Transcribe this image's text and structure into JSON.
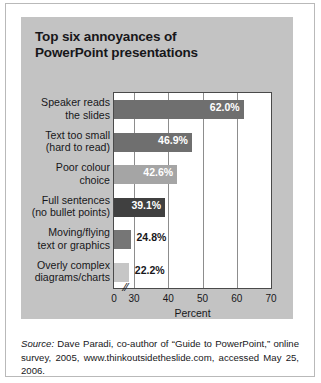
{
  "figure": {
    "title_lines": [
      "Top six annoyances of",
      "PowerPoint presentations"
    ],
    "source_label": "Source:",
    "source_text": " Dave Paradi, co-author of “Guide to PowerPoint,” online survey, 2005, www.thinkoutsidetheslide.com, accessed May 25, 2006.",
    "panel_color": "#c3c3c3",
    "plot_background": "#ffffff"
  },
  "chart_data": {
    "type": "bar",
    "orientation": "horizontal",
    "title": "Top six annoyances of PowerPoint presentations",
    "xlabel": "Percent",
    "ylabel": "",
    "xlim": [
      0,
      70
    ],
    "axis_break": {
      "present": true,
      "between": [
        0,
        30
      ],
      "symbol": "//"
    },
    "xticks": [
      "0",
      "30",
      "40",
      "50",
      "60",
      "70"
    ],
    "xtick_values": [
      0,
      30,
      40,
      50,
      60,
      70
    ],
    "grid": true,
    "legend": "none",
    "categories": [
      "Speaker reads the slides",
      "Text too small (hard to read)",
      "Poor colour choice",
      "Full sentences (no bullet points)",
      "Moving/flying text or graphics",
      "Overly complex diagrams/charts"
    ],
    "category_lines": [
      [
        "Speaker reads",
        "the slides"
      ],
      [
        "Text too small",
        "(hard to read)"
      ],
      [
        "Poor colour",
        "choice"
      ],
      [
        "Full sentences",
        "(no bullet points)"
      ],
      [
        "Moving/flying",
        "text or graphics"
      ],
      [
        "Overly complex",
        "diagrams/charts"
      ]
    ],
    "values": [
      62.0,
      46.9,
      42.6,
      39.1,
      24.8,
      22.2
    ],
    "value_labels": [
      "62.0%",
      "46.9%",
      "42.6%",
      "39.1%",
      "24.8%",
      "22.2%"
    ],
    "bar_colors": [
      "#6f6f6f",
      "#6f6f6f",
      "#a5a5a5",
      "#404040",
      "#767676",
      "#c6c6c6"
    ],
    "label_placement": [
      "inside",
      "inside",
      "inside",
      "inside",
      "outside",
      "outside"
    ]
  }
}
